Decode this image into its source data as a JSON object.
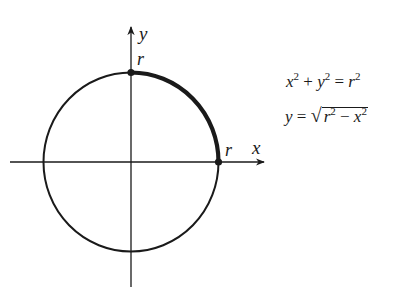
{
  "diagram": {
    "axes": {
      "x_label": "x",
      "y_label": "y"
    },
    "points": [
      {
        "name": "top",
        "label": "r",
        "coords": [
          0,
          "r"
        ]
      },
      {
        "name": "right",
        "label": "r",
        "coords": [
          "r",
          0
        ]
      }
    ],
    "circle": {
      "center": [
        0,
        0
      ],
      "radius": "r"
    },
    "highlighted_arc": {
      "from": "(0, r)",
      "to": "(r, 0)",
      "quadrant": "first"
    }
  },
  "equations": {
    "eq1": {
      "lhs_a": "x",
      "exp_a": "2",
      "plus": " + ",
      "lhs_b": "y",
      "exp_b": "2",
      "equals": " = ",
      "rhs": "r",
      "exp_rhs": "2"
    },
    "eq2": {
      "lhs": "y",
      "equals": " = ",
      "sqrt": "√",
      "rad_a": "r",
      "exp_a": "2",
      "minus": " − ",
      "rad_b": "x",
      "exp_b": "2"
    }
  },
  "colors": {
    "stroke": "#1a1a1a",
    "background": "#ffffff"
  }
}
